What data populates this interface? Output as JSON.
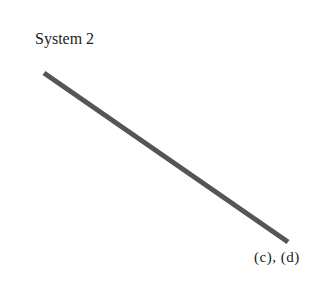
{
  "diagram": {
    "title": "System 2",
    "line": {
      "x1": 44,
      "y1": 73,
      "x2": 288,
      "y2": 242,
      "color": "#555555",
      "width": 5
    },
    "end_label": "(c), (d)"
  }
}
